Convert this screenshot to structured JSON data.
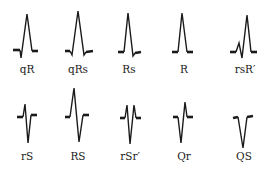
{
  "figure": {
    "rows": [
      {
        "items": [
          {
            "label": "qR",
            "cx": 27,
            "label_y": 73,
            "baseline_left": [
              [
                13,
                50
              ],
              [
                20,
                50
              ]
            ],
            "trace": [
              [
                20,
                50
              ],
              [
                21,
                58
              ],
              [
                27,
                14
              ],
              [
                32,
                51
              ]
            ],
            "baseline_right": [
              [
                32,
                51
              ],
              [
                38,
                51
              ]
            ]
          },
          {
            "label": "qRs",
            "cx": 78,
            "label_y": 73,
            "baseline_left": [
              [
                65,
                51
              ],
              [
                70,
                51
              ]
            ],
            "trace": [
              [
                70,
                51
              ],
              [
                72,
                55
              ],
              [
                78,
                11
              ],
              [
                84,
                55
              ],
              [
                86,
                52
              ]
            ],
            "baseline_right": [
              [
                86,
                52
              ],
              [
                93,
                51
              ]
            ]
          },
          {
            "label": "Rs",
            "cx": 129,
            "label_y": 73,
            "baseline_left": [
              [
                118,
                52
              ],
              [
                124,
                52
              ]
            ],
            "trace": [
              [
                124,
                52
              ],
              [
                128,
                13
              ],
              [
                133,
                56
              ],
              [
                135,
                53
              ]
            ],
            "baseline_right": [
              [
                135,
                53
              ],
              [
                141,
                52
              ]
            ]
          },
          {
            "label": "R",
            "cx": 184,
            "label_y": 73,
            "baseline_left": [
              [
                172,
                52
              ],
              [
                178,
                52
              ]
            ],
            "trace": [
              [
                178,
                52
              ],
              [
                182,
                13
              ],
              [
                187,
                52
              ]
            ],
            "baseline_right": [
              [
                187,
                52
              ],
              [
                193,
                52
              ]
            ]
          },
          {
            "label": "rsR′",
            "cx": 245,
            "label_y": 73,
            "baseline_left": [
              [
                230,
                52
              ],
              [
                236,
                52
              ]
            ],
            "trace": [
              [
                236,
                52
              ],
              [
                239,
                43
              ],
              [
                242,
                58
              ],
              [
                247,
                15
              ],
              [
                251,
                52
              ]
            ],
            "baseline_right": [
              [
                251,
                52
              ],
              [
                257,
                52
              ]
            ]
          }
        ]
      },
      {
        "items": [
          {
            "label": "rS",
            "cx": 27,
            "label_y": 160,
            "baseline_left": [
              [
                17,
                117
              ],
              [
                23,
                117
              ]
            ],
            "trace": [
              [
                23,
                117
              ],
              [
                25,
                104
              ],
              [
                28,
                143
              ],
              [
                31,
                115
              ]
            ],
            "baseline_right": [
              [
                31,
                115
              ],
              [
                37,
                115
              ]
            ]
          },
          {
            "label": "RS",
            "cx": 78,
            "label_y": 160,
            "baseline_left": [
              [
                65,
                117
              ],
              [
                70,
                117
              ]
            ],
            "trace": [
              [
                70,
                117
              ],
              [
                74,
                88
              ],
              [
                79,
                142
              ],
              [
                83,
                115
              ]
            ],
            "baseline_right": [
              [
                83,
                115
              ],
              [
                89,
                115
              ]
            ]
          },
          {
            "label": "rSr′",
            "cx": 130,
            "label_y": 160,
            "baseline_left": [
              [
                120,
                118
              ],
              [
                125,
                118
              ]
            ],
            "trace": [
              [
                125,
                118
              ],
              [
                127,
                105
              ],
              [
                130,
                144
              ],
              [
                134,
                105
              ],
              [
                136,
                118
              ]
            ],
            "baseline_right": [
              [
                136,
                118
              ],
              [
                141,
                118
              ]
            ]
          },
          {
            "label": "Qr",
            "cx": 184,
            "label_y": 160,
            "baseline_left": [
              [
                173,
                117
              ],
              [
                178,
                117
              ]
            ],
            "trace": [
              [
                178,
                117
              ],
              [
                181,
                143
              ],
              [
                185,
                102
              ],
              [
                187,
                117
              ]
            ],
            "baseline_right": [
              [
                187,
                117
              ],
              [
                193,
                117
              ]
            ]
          },
          {
            "label": "QS",
            "cx": 244,
            "label_y": 160,
            "baseline_left": [
              [
                233,
                118
              ],
              [
                238,
                117
              ]
            ],
            "trace": [
              [
                238,
                117
              ],
              [
                243,
                148
              ],
              [
                247,
                117
              ]
            ],
            "baseline_right": [
              [
                247,
                117
              ],
              [
                253,
                116
              ]
            ]
          }
        ]
      }
    ],
    "colors": {
      "ink": "#1a1a1a",
      "label": "#222222",
      "background": "#ffffff"
    }
  }
}
